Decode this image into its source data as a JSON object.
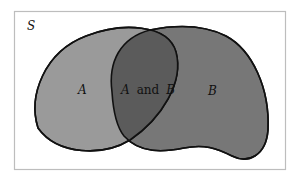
{
  "diagram": {
    "type": "venn",
    "universe_label": "S",
    "sets": [
      {
        "id": "A",
        "label": "A",
        "fill": "#9a9a9a"
      },
      {
        "id": "B",
        "label": "B",
        "fill": "#777777"
      }
    ],
    "intersection": {
      "label_a": "A",
      "label_and": "and",
      "label_b": "B",
      "fill": "#5b5b5b"
    },
    "colors": {
      "frame": "#bdbdbd",
      "outline": "#111111",
      "background": "#ffffff"
    }
  }
}
